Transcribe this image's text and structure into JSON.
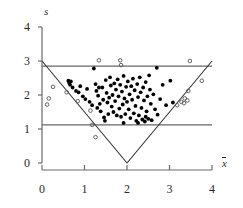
{
  "chart_data": {
    "type": "scatter",
    "title": "",
    "xlabel": "x̄",
    "ylabel": "s",
    "xlim": [
      0,
      4
    ],
    "ylim": [
      0,
      4
    ],
    "xticks": [
      0,
      1,
      2,
      3,
      4
    ],
    "yticks": [
      0,
      1,
      2,
      3,
      4
    ],
    "xtick_labels": [
      "0",
      "1",
      "2",
      "3",
      "4"
    ],
    "ytick_labels": [
      "0",
      "1",
      "2",
      "3",
      "4"
    ],
    "grid": false,
    "legend": null,
    "series": [
      {
        "name": "inlier",
        "marker": "filled-circle",
        "color": "#000000",
        "points": [
          [
            0.62,
            2.42
          ],
          [
            0.64,
            2.36
          ],
          [
            0.68,
            2.4
          ],
          [
            0.66,
            2.3
          ],
          [
            0.72,
            2.22
          ],
          [
            0.8,
            2.12
          ],
          [
            0.86,
            2.08
          ],
          [
            0.9,
            2.26
          ],
          [
            0.96,
            1.96
          ],
          [
            1.02,
            1.88
          ],
          [
            1.06,
            2.18
          ],
          [
            1.12,
            1.8
          ],
          [
            1.18,
            1.7
          ],
          [
            1.22,
            2.78
          ],
          [
            1.26,
            2.32
          ],
          [
            1.28,
            2.12
          ],
          [
            1.3,
            1.62
          ],
          [
            1.32,
            1.98
          ],
          [
            1.36,
            1.74
          ],
          [
            1.38,
            1.52
          ],
          [
            1.42,
            2.22
          ],
          [
            1.44,
            1.86
          ],
          [
            1.46,
            1.34
          ],
          [
            1.5,
            2.44
          ],
          [
            1.52,
            2.06
          ],
          [
            1.54,
            1.78
          ],
          [
            1.56,
            1.44
          ],
          [
            1.58,
            1.92
          ],
          [
            1.6,
            2.52
          ],
          [
            1.62,
            2.28
          ],
          [
            1.64,
            1.66
          ],
          [
            1.66,
            2.0
          ],
          [
            1.68,
            1.5
          ],
          [
            1.7,
            2.34
          ],
          [
            1.72,
            1.82
          ],
          [
            1.74,
            2.16
          ],
          [
            1.76,
            1.4
          ],
          [
            1.78,
            2.46
          ],
          [
            1.8,
            1.96
          ],
          [
            1.82,
            1.6
          ],
          [
            1.84,
            2.3
          ],
          [
            1.86,
            1.36
          ],
          [
            1.88,
            2.1
          ],
          [
            1.9,
            1.72
          ],
          [
            1.92,
            2.56
          ],
          [
            1.94,
            1.9
          ],
          [
            1.96,
            1.44
          ],
          [
            1.98,
            2.24
          ],
          [
            2.0,
            1.8
          ],
          [
            2.02,
            2.4
          ],
          [
            2.04,
            1.58
          ],
          [
            2.06,
            2.02
          ],
          [
            2.08,
            1.32
          ],
          [
            2.1,
            2.26
          ],
          [
            2.12,
            1.86
          ],
          [
            2.14,
            2.48
          ],
          [
            2.16,
            1.46
          ],
          [
            2.18,
            2.14
          ],
          [
            2.2,
            1.68
          ],
          [
            2.22,
            1.24
          ],
          [
            2.24,
            2.32
          ],
          [
            2.26,
            1.94
          ],
          [
            2.28,
            1.4
          ],
          [
            2.3,
            2.52
          ],
          [
            2.32,
            2.08
          ],
          [
            2.34,
            1.62
          ],
          [
            2.36,
            1.28
          ],
          [
            2.38,
            2.22
          ],
          [
            2.4,
            1.84
          ],
          [
            2.42,
            1.22
          ],
          [
            2.44,
            2.38
          ],
          [
            2.46,
            1.52
          ],
          [
            2.48,
            1.96
          ],
          [
            2.5,
            1.3
          ],
          [
            2.52,
            2.58
          ],
          [
            2.54,
            2.16
          ],
          [
            2.56,
            1.74
          ],
          [
            2.58,
            1.26
          ],
          [
            2.62,
            2.02
          ],
          [
            2.66,
            1.58
          ],
          [
            2.7,
            2.8
          ],
          [
            2.72,
            1.42
          ],
          [
            2.78,
            1.88
          ],
          [
            2.84,
            2.3
          ],
          [
            2.92,
            1.7
          ],
          [
            3.02,
            2.42
          ],
          [
            3.08,
            1.78
          ],
          [
            1.34,
            2.22
          ],
          [
            1.48,
            1.24
          ],
          [
            2.26,
            1.18
          ],
          [
            1.92,
            1.18
          ],
          [
            2.44,
            1.36
          ]
        ]
      },
      {
        "name": "outlier",
        "marker": "open-circle",
        "color": "#555555",
        "points": [
          [
            0.12,
            1.72
          ],
          [
            0.16,
            1.9
          ],
          [
            0.26,
            2.24
          ],
          [
            0.58,
            2.08
          ],
          [
            0.84,
            1.82
          ],
          [
            1.14,
            1.54
          ],
          [
            1.18,
            1.12
          ],
          [
            1.26,
            0.76
          ],
          [
            1.34,
            3.02
          ],
          [
            1.84,
            3.02
          ],
          [
            1.86,
            2.88
          ],
          [
            3.18,
            1.7
          ],
          [
            3.28,
            1.8
          ],
          [
            3.34,
            1.76
          ],
          [
            3.36,
            1.9
          ],
          [
            3.42,
            1.84
          ],
          [
            3.44,
            2.12
          ],
          [
            3.48,
            3.0
          ],
          [
            3.76,
            2.42
          ]
        ]
      }
    ],
    "annotations": {
      "triangle": {
        "description": "constraint boundary",
        "vertices": [
          [
            0,
            3
          ],
          [
            2,
            0
          ],
          [
            4,
            3
          ]
        ],
        "color": "#333333"
      },
      "reference_lines": [
        {
          "name": "upper-limit",
          "orientation": "horizontal",
          "value": 2.85,
          "color": "#666666"
        },
        {
          "name": "lower-limit",
          "orientation": "horizontal",
          "value": 1.12,
          "color": "#666666"
        }
      ]
    }
  },
  "axes": {
    "y_title": "s",
    "x_title": "x"
  }
}
